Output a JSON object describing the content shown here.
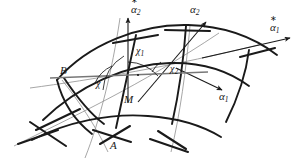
{
  "figure": {
    "background_color": "#ffffff",
    "stroke_dark": "#1a1a1a",
    "stroke_light": "#8a8a8a",
    "points": [
      {
        "id": "A",
        "label": "A",
        "x": 112,
        "y": 147
      },
      {
        "id": "B",
        "label": "B",
        "x": 62,
        "y": 72
      },
      {
        "id": "M",
        "label": "M",
        "x": 126,
        "y": 100
      }
    ],
    "vectors": [
      {
        "id": "alpha1",
        "base": "α",
        "subscript": "1",
        "starred": false,
        "x": 221,
        "y": 97
      },
      {
        "id": "alpha2",
        "base": "α",
        "subscript": "2",
        "starred": false,
        "x": 192,
        "y": 10
      },
      {
        "id": "alpha1star",
        "base": "α",
        "subscript": "1",
        "starred": true,
        "x": 272,
        "y": 27
      },
      {
        "id": "alpha2star",
        "base": "α",
        "subscript": "2",
        "starred": true,
        "x": 133,
        "y": 10
      }
    ],
    "angles": [
      {
        "id": "chi",
        "base": "χ",
        "subscript": "",
        "x": 98,
        "y": 82
      },
      {
        "id": "chi1",
        "base": "χ",
        "subscript": "1",
        "x": 139,
        "y": 50
      },
      {
        "id": "chi2",
        "base": "χ",
        "subscript": "2",
        "x": 171,
        "y": 68
      }
    ]
  }
}
